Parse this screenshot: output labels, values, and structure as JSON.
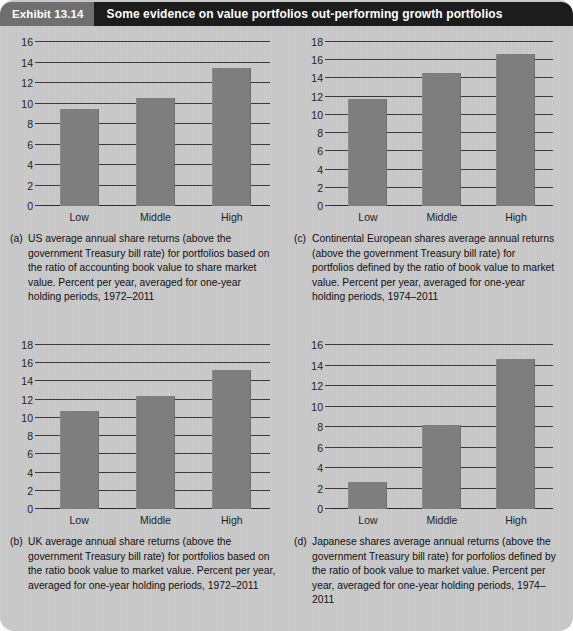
{
  "header": {
    "exhibit_number": "Exhibit 13.14",
    "title": "Some evidence on value portfolios out-performing growth portfolios",
    "number_bg": "#6f6f6f",
    "title_bg": "#1c1c1c",
    "text_color": "#ffffff"
  },
  "colors": {
    "background": "#c9c9c9",
    "bar": "#7e7e7e",
    "axis": "#2b2b2b",
    "text": "#101010"
  },
  "panels": [
    {
      "key": "a",
      "label": "(a)",
      "caption": "US average annual share returns (above the government Treasury bill rate) for portfolios based on the ratio of accounting book value to share market value. Percent per year, averaged for one-year holding periods, 1972–2011"
    },
    {
      "key": "c",
      "label": "(c)",
      "caption": "Continental European shares average annual returns (above the government Treasury bill rate) for portfolios defined by the ratio of book value to market value.  Percent per year, averaged for one-year holding periods, 1974–2011"
    },
    {
      "key": "b",
      "label": "(b)",
      "caption": "UK average annual share returns (above the government Treasury bill rate) for portfolios based on the ratio book value to market value. Percent per year, averaged for one-year holding periods, 1972–2011"
    },
    {
      "key": "d",
      "label": "(d)",
      "caption": "Japanese shares average annual returns (above the government Treasury bill rate) for porfolios defined by the ratio of book value to market value.  Percent per year, averaged for one-year holding periods, 1974–2011"
    }
  ],
  "chart_data": [
    {
      "type": "bar",
      "key": "a",
      "title": "(a) US average annual share returns",
      "categories": [
        "Low",
        "Middle",
        "High"
      ],
      "values": [
        9.5,
        10.5,
        13.5
      ],
      "yticks": [
        0,
        2,
        4,
        6,
        8,
        10,
        12,
        14,
        16
      ],
      "ylim": [
        0,
        16
      ],
      "xlabel": "",
      "ylabel": "",
      "grid": true,
      "legend": "none"
    },
    {
      "type": "bar",
      "key": "c",
      "title": "(c) Continental European shares average annual returns",
      "categories": [
        "Low",
        "Middle",
        "High"
      ],
      "values": [
        11.8,
        14.6,
        16.7
      ],
      "yticks": [
        0,
        2,
        4,
        6,
        8,
        10,
        12,
        14,
        16,
        18
      ],
      "ylim": [
        0,
        18
      ],
      "xlabel": "",
      "ylabel": "",
      "grid": true,
      "legend": "none"
    },
    {
      "type": "bar",
      "key": "b",
      "title": "(b) UK average annual share returns",
      "categories": [
        "Low",
        "Middle",
        "High"
      ],
      "values": [
        10.8,
        12.4,
        15.3
      ],
      "yticks": [
        0,
        2,
        4,
        6,
        8,
        10,
        12,
        14,
        16,
        18
      ],
      "ylim": [
        0,
        18
      ],
      "xlabel": "",
      "ylabel": "",
      "grid": true,
      "legend": "none"
    },
    {
      "type": "bar",
      "key": "d",
      "title": "(d) Japanese shares average annual returns",
      "categories": [
        "Low",
        "Middle",
        "High"
      ],
      "values": [
        2.6,
        8.2,
        14.6
      ],
      "yticks": [
        0,
        2,
        4,
        6,
        8,
        10,
        12,
        14,
        16
      ],
      "ylim": [
        0,
        16
      ],
      "xlabel": "",
      "ylabel": "",
      "grid": true,
      "legend": "none"
    }
  ]
}
